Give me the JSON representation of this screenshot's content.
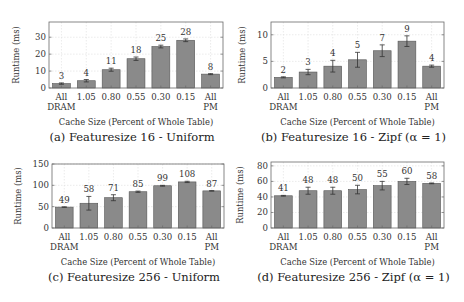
{
  "chart_data": [
    {
      "id": "a",
      "type": "bar",
      "title": "(a) Featuresize 16 - Uniform",
      "xlabel": "Cache Size (Percent of Whole Table)",
      "ylabel": "Runtime (ms)",
      "categories": [
        "All DRAM",
        "1.05",
        "0.80",
        "0.55",
        "0.30",
        "0.15",
        "All PM"
      ],
      "values": [
        3,
        4,
        11,
        18,
        25,
        28,
        8
      ],
      "value_labels": [
        "3",
        "4",
        "11",
        "18",
        "25",
        "28",
        "8"
      ],
      "bar_values": [
        2.6,
        4.3,
        10.8,
        17.3,
        24.5,
        28.2,
        8.2
      ],
      "errors": [
        0.4,
        0.7,
        0.9,
        1.0,
        0.8,
        0.8,
        0.3
      ],
      "ylim": [
        0,
        39
      ],
      "yticks": [
        0,
        10,
        20,
        30
      ],
      "grid": true,
      "legend": null,
      "frame": {
        "x": 49,
        "y": 22,
        "w": 174,
        "h": 66
      },
      "label_x": 20,
      "label_w": 230,
      "ylabel_x": 10
    },
    {
      "id": "b",
      "type": "bar",
      "title": "(b) Featuresize 16 - Zipf (α = 1)",
      "xlabel": "Cache Size (Percent of Whole Table)",
      "ylabel": "Runtime (ms)",
      "categories": [
        "All DRAM",
        "1.05",
        "0.80",
        "0.55",
        "0.30",
        "0.15",
        "All PM"
      ],
      "values": [
        2,
        3,
        4,
        5,
        7,
        9,
        4
      ],
      "value_labels": [
        "2",
        "3",
        "4",
        "5",
        "7",
        "9",
        "4"
      ],
      "bar_values": [
        2.0,
        3.0,
        4.1,
        5.3,
        7.0,
        8.8,
        4.1
      ],
      "errors": [
        0.1,
        0.5,
        1.1,
        1.4,
        1.1,
        1.0,
        0.2
      ],
      "ylim": [
        0,
        12.4
      ],
      "yticks": [
        0,
        5,
        10
      ],
      "grid": true,
      "legend": null,
      "frame": {
        "x": 271,
        "y": 22,
        "w": 173,
        "h": 66
      },
      "label_x": 240,
      "label_w": 230,
      "ylabel_x": 236
    },
    {
      "id": "c",
      "type": "bar",
      "title": "(c) Featuresize 256 - Uniform",
      "xlabel": "Cache Size (Percent of Whole Table)",
      "ylabel": "Runtime (ms)",
      "categories": [
        "All DRAM",
        "1.05",
        "0.80",
        "0.55",
        "0.30",
        "0.15",
        "All PM"
      ],
      "values": [
        49,
        58,
        71,
        85,
        99,
        108,
        87
      ],
      "value_labels": [
        "49",
        "58",
        "71",
        "85",
        "99",
        "108",
        "87"
      ],
      "bar_values": [
        49,
        58,
        71,
        85,
        99,
        108,
        87
      ],
      "errors": [
        0.5,
        16,
        7,
        1.5,
        1,
        1.5,
        0.5
      ],
      "ylim": [
        0,
        150
      ],
      "yticks": [
        0,
        50,
        100,
        150
      ],
      "grid": true,
      "legend": null,
      "frame": {
        "x": 52,
        "y": 164,
        "w": 172,
        "h": 64
      },
      "label_x": 20,
      "label_w": 230,
      "ylabel_x": 12
    },
    {
      "id": "d",
      "type": "bar",
      "title": "(d) Featuresize 256 - Zipf (α = 1)",
      "xlabel": "Cache Size (Percent of Whole Table)",
      "ylabel": "Runtime (ms)",
      "categories": [
        "All DRAM",
        "1.05",
        "0.80",
        "0.55",
        "0.30",
        "0.15",
        "All PM"
      ],
      "values": [
        41,
        48,
        48,
        50,
        55,
        60,
        58
      ],
      "value_labels": [
        "41",
        "48",
        "48",
        "50",
        "55",
        "60",
        "58"
      ],
      "bar_values": [
        41.5,
        48,
        48,
        49.5,
        54.5,
        60,
        57.5
      ],
      "errors": [
        0.5,
        4.5,
        4.5,
        5.5,
        5.5,
        4,
        0.5
      ],
      "ylim": [
        0,
        85
      ],
      "yticks": [
        0,
        20,
        40,
        60,
        80
      ],
      "grid": true,
      "legend": null,
      "frame": {
        "x": 271,
        "y": 162,
        "w": 173,
        "h": 66
      },
      "label_x": 240,
      "label_w": 230,
      "ylabel_x": 234
    }
  ],
  "style": {
    "bar_fill": "#8a8a8a",
    "bar_stroke": "#555555",
    "frame_color": "#6a6a6a",
    "grid_color": "#dddddd",
    "text_color": "#333333"
  }
}
